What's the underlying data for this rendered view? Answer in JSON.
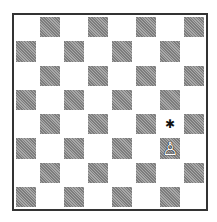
{
  "board": {
    "files": [
      "a",
      "b",
      "c",
      "d",
      "e",
      "f",
      "g",
      "h"
    ],
    "ranks": [
      8,
      7,
      6,
      5,
      4,
      3,
      2,
      1
    ],
    "pieces": [
      {
        "square": "g3",
        "piece": "white-pawn",
        "glyph": "♙"
      }
    ],
    "markers": [
      {
        "square": "g4",
        "type": "star",
        "glyph": "✱"
      }
    ],
    "colors": {
      "light": "#ffffff",
      "dark": "#939393",
      "border": "#333333"
    }
  }
}
